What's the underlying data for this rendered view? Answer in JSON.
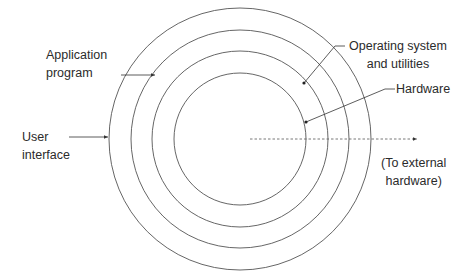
{
  "diagram": {
    "type": "concentric-layers",
    "center": [
      240,
      139
    ],
    "rings": [
      {
        "name": "user-interface",
        "radius": 131
      },
      {
        "name": "application-program",
        "radius": 109
      },
      {
        "name": "operating-system-and-utilities",
        "radius": 88
      },
      {
        "name": "hardware",
        "radius": 66
      }
    ],
    "stroke_color": "#555555",
    "labels": {
      "user_interface": {
        "line1": "User",
        "line2": "interface"
      },
      "application_program": {
        "line1": "Application",
        "line2": "program"
      },
      "operating_system": {
        "line1": "Operating system",
        "line2": "and utilities"
      },
      "hardware": {
        "line1": "Hardware"
      },
      "external_hardware": {
        "line1": "(To external",
        "line2": "hardware)"
      }
    }
  }
}
